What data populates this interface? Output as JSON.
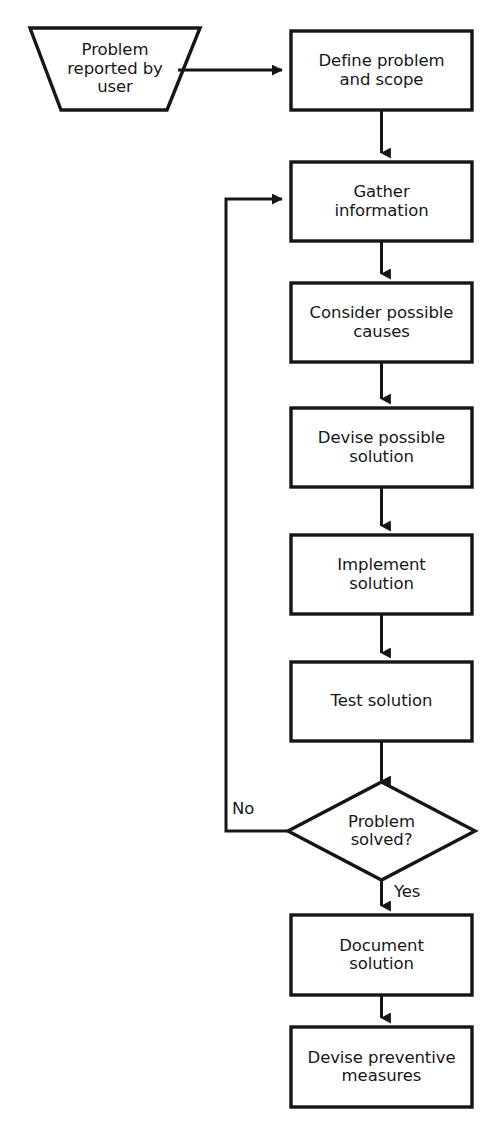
{
  "diagram": {
    "background_color": "#ffffff",
    "stroke_color": "#161616",
    "text_color": "#171717",
    "nodes": [
      {
        "id": "problem-reported",
        "shape": "trapezoid",
        "label": "Problem\nreported by\nuser",
        "x": 30,
        "y": 28,
        "width": 170,
        "height": 82,
        "inset": 30
      },
      {
        "id": "define-problem",
        "shape": "rectangle",
        "label": "Define problem\nand scope",
        "x": 291,
        "y": 31,
        "width": 181,
        "height": 79
      },
      {
        "id": "gather-information",
        "shape": "rectangle",
        "label": "Gather\ninformation",
        "x": 291,
        "y": 162,
        "width": 181,
        "height": 79
      },
      {
        "id": "consider-causes",
        "shape": "rectangle",
        "label": "Consider possible\ncauses",
        "x": 291,
        "y": 283,
        "width": 181,
        "height": 79
      },
      {
        "id": "devise-solution",
        "shape": "rectangle",
        "label": "Devise possible\nsolution",
        "x": 291,
        "y": 408,
        "width": 181,
        "height": 79
      },
      {
        "id": "implement-solution",
        "shape": "rectangle",
        "label": "Implement\nsolution",
        "x": 291,
        "y": 535,
        "width": 181,
        "height": 79
      },
      {
        "id": "test-solution",
        "shape": "rectangle",
        "label": "Test solution",
        "x": 291,
        "y": 662,
        "width": 181,
        "height": 79
      },
      {
        "id": "problem-solved",
        "shape": "diamond",
        "label": "Problem\nsolved?",
        "x": 288,
        "y": 782,
        "width": 187,
        "height": 98
      },
      {
        "id": "document-solution",
        "shape": "rectangle",
        "label": "Document\nsolution",
        "x": 291,
        "y": 915,
        "width": 181,
        "height": 80
      },
      {
        "id": "devise-preventive",
        "shape": "rectangle",
        "label": "Devise preventive\nmeasures",
        "x": 291,
        "y": 1027,
        "width": 181,
        "height": 80
      }
    ],
    "edges": [
      {
        "id": "e-report-to-define",
        "from": "problem-reported",
        "to": "define-problem",
        "label": ""
      },
      {
        "id": "e-define-to-gather",
        "from": "define-problem",
        "to": "gather-information",
        "label": ""
      },
      {
        "id": "e-gather-to-consider",
        "from": "gather-information",
        "to": "consider-causes",
        "label": ""
      },
      {
        "id": "e-consider-to-devise",
        "from": "consider-causes",
        "to": "devise-solution",
        "label": ""
      },
      {
        "id": "e-devise-to-implement",
        "from": "devise-solution",
        "to": "implement-solution",
        "label": ""
      },
      {
        "id": "e-implement-to-test",
        "from": "implement-solution",
        "to": "test-solution",
        "label": ""
      },
      {
        "id": "e-test-to-decision",
        "from": "test-solution",
        "to": "problem-solved",
        "label": ""
      },
      {
        "id": "e-decision-no-loop",
        "from": "problem-solved",
        "to": "gather-information",
        "label": "No"
      },
      {
        "id": "e-decision-yes",
        "from": "problem-solved",
        "to": "document-solution",
        "label": "Yes"
      },
      {
        "id": "e-document-to-preventive",
        "from": "document-solution",
        "to": "devise-preventive",
        "label": ""
      }
    ],
    "edge_labels": {
      "no": {
        "text": "No",
        "x": 232,
        "y": 801
      },
      "yes": {
        "text": "Yes",
        "x": 394,
        "y": 884
      }
    }
  }
}
